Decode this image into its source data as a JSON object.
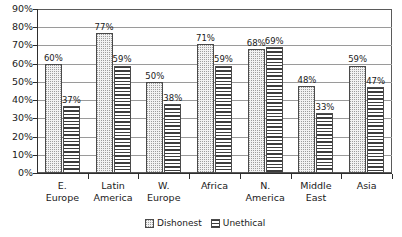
{
  "chart_data": {
    "type": "bar",
    "title": "",
    "subtitle": "",
    "xlabel": "",
    "ylabel": "",
    "ylim": [
      0,
      90
    ],
    "ytick_step": 10,
    "ytick_labels": [
      "0%",
      "10%",
      "20%",
      "30%",
      "40%",
      "50%",
      "60%",
      "70%",
      "80%",
      "90%"
    ],
    "grid": true,
    "legend_position": "bottom-center",
    "value_label_suffix": "%",
    "categories": [
      "E. Europe",
      "Latin America",
      "W. Europe",
      "Africa",
      "N. America",
      "Middle East",
      "Asia"
    ],
    "category_lines": [
      [
        "E.",
        "Europe"
      ],
      [
        "Latin",
        "America"
      ],
      [
        "W.",
        "Europe"
      ],
      [
        "Africa",
        ""
      ],
      [
        "N.",
        "America"
      ],
      [
        "Middle",
        "East"
      ],
      [
        "Asia",
        ""
      ]
    ],
    "series": [
      {
        "name": "Dishonest",
        "pattern": "dotted",
        "values": [
          60,
          77,
          50,
          71,
          68,
          48,
          59
        ],
        "labels": [
          "60%",
          "77%",
          "50%",
          "71%",
          "68%",
          "48%",
          "59%"
        ]
      },
      {
        "name": "Unethical",
        "pattern": "horizontal-stripes",
        "values": [
          37,
          59,
          38,
          59,
          69,
          33,
          47
        ],
        "labels": [
          "37%",
          "59%",
          "38%",
          "59%",
          "69%",
          "33%",
          "47%"
        ]
      }
    ]
  },
  "colors": {
    "axis": "#2e2e2e",
    "grid": "#9a9a9a",
    "bar_border": "#4a4a4a",
    "dishonest_fill": "#f2f2f2",
    "unethical_fill": "#ffffff",
    "text": "#1a1a1a",
    "background": "#ffffff"
  },
  "legend": {
    "items": [
      {
        "label": "Dishonest"
      },
      {
        "label": "Unethical"
      }
    ]
  }
}
